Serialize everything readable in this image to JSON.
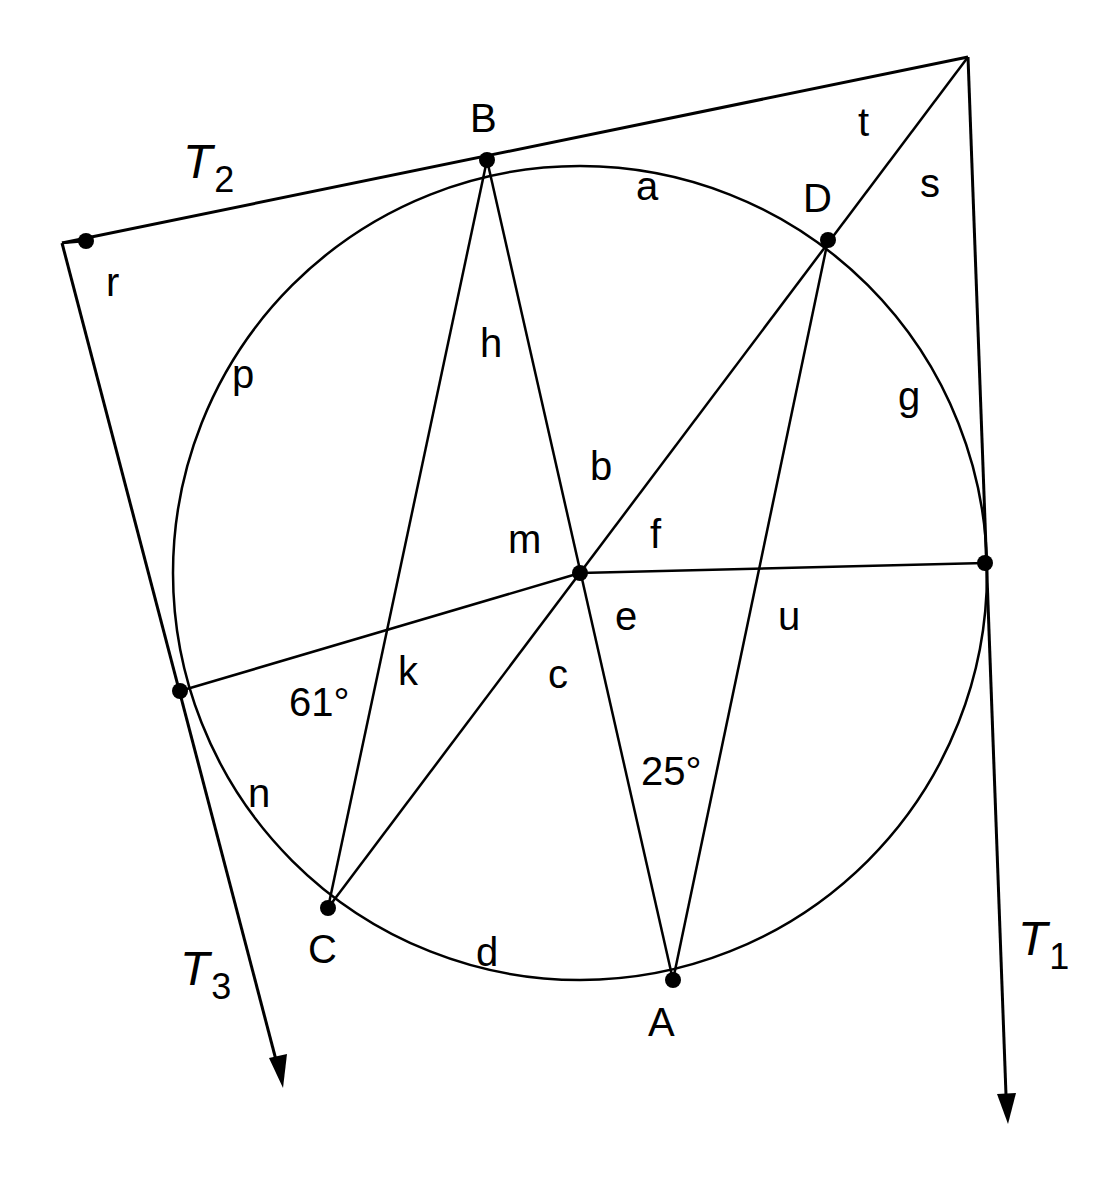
{
  "diagram": {
    "type": "circle-geometry",
    "colors": {
      "stroke": "#000000",
      "background": "#ffffff"
    },
    "circle": {
      "center": [
        580,
        573
      ],
      "radius": 407
    },
    "points": {
      "O": {
        "label": "",
        "x": 580,
        "y": 573
      },
      "B": {
        "label": "B",
        "x": 487,
        "y": 160
      },
      "D": {
        "label": "D",
        "x": 828,
        "y": 240
      },
      "E": {
        "label": "",
        "x": 985,
        "y": 563
      },
      "F": {
        "label": "",
        "x": 180,
        "y": 691
      },
      "C": {
        "label": "C",
        "x": 328,
        "y": 908
      },
      "A": {
        "label": "A",
        "x": 673,
        "y": 980
      },
      "R": {
        "label": "",
        "x": 86,
        "y": 241
      }
    },
    "tangents": {
      "t1": {
        "label": "T",
        "subscript": "1"
      },
      "t2": {
        "label": "T",
        "subscript": "2"
      },
      "t3": {
        "label": "T",
        "subscript": "3"
      }
    },
    "angle_labels": {
      "a": "a",
      "b": "b",
      "c": "c",
      "d": "d",
      "e": "e",
      "f": "f",
      "g": "g",
      "h": "h",
      "k": "k",
      "m": "m",
      "n": "n",
      "p": "p",
      "r": "r",
      "s": "s",
      "t": "t",
      "u": "u"
    },
    "given_angles": {
      "angle_61": "61°",
      "angle_25": "25°"
    }
  }
}
